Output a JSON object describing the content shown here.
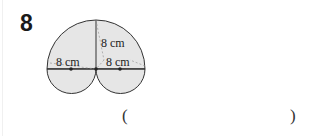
{
  "question": {
    "number": "8",
    "labels": {
      "left_radius": "8 cm",
      "vertical": "8 cm",
      "right_radius": "8 cm"
    },
    "answer": {
      "open": "(",
      "close": ")",
      "value": ""
    }
  },
  "colors": {
    "shape_fill": "#e6e6e6",
    "stroke": "#333333"
  }
}
